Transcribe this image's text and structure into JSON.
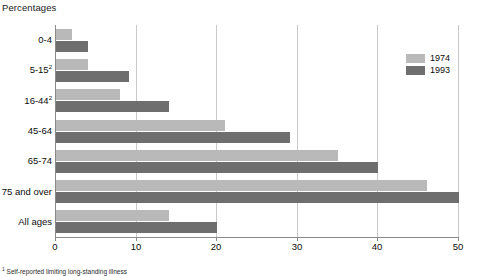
{
  "axis_title": "Percentages",
  "footnote": {
    "marker": "1",
    "text": "Self-reported limiting long-standing illness"
  },
  "legend": {
    "position": "top-right",
    "entries": [
      {
        "label": "1974",
        "color": "#b9b9b9"
      },
      {
        "label": "1993",
        "color": "#6e6e6e"
      }
    ]
  },
  "colors": {
    "series_1974": "#b9b9b9",
    "series_1993": "#6e6e6e",
    "gridline": "#c9c9c9",
    "axis": "#8a8a8a",
    "text": "#0d0d0d",
    "background": "#ffffff"
  },
  "chart_data": {
    "type": "bar",
    "orientation": "horizontal",
    "title": "",
    "subtitle": "",
    "xlabel": "Percentages",
    "ylabel": "",
    "xlim": [
      0,
      50
    ],
    "xticks": [
      0,
      10,
      20,
      30,
      40,
      50
    ],
    "grid": "vertical",
    "legend_position": "top-right",
    "categories": [
      "0-4",
      "5-15",
      "16-44",
      "45-64",
      "65-74",
      "75 and over",
      "All ages"
    ],
    "category_footnote_marks": [
      "",
      "2",
      "2",
      "",
      "",
      "",
      ""
    ],
    "series": [
      {
        "name": "1974",
        "color": "#b9b9b9",
        "values": [
          2,
          4,
          8,
          21,
          35,
          46,
          14
        ]
      },
      {
        "name": "1993",
        "color": "#6e6e6e",
        "values": [
          4,
          9,
          14,
          29,
          40,
          50,
          20
        ]
      }
    ]
  }
}
